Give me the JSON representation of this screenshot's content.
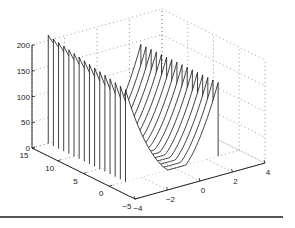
{
  "chart_data": {
    "type": "line",
    "subtype": "3d-waterfall",
    "title": "",
    "xlabel": "",
    "ylabel": "",
    "zlabel": "",
    "x_ticks": [
      -4,
      -2,
      0,
      2,
      4
    ],
    "y_ticks": [
      -5,
      0,
      5,
      10,
      15
    ],
    "z_ticks": [
      0,
      50,
      100,
      150,
      200
    ],
    "xlim": [
      -4,
      4
    ],
    "ylim": [
      -5,
      15
    ],
    "zlim": [
      0,
      200
    ],
    "grid": true,
    "x_range_of_curves": [
      -3,
      2.7
    ],
    "y_values_of_curves": [
      0,
      1,
      2,
      3,
      4,
      5,
      6,
      7,
      8,
      9,
      10,
      11,
      12,
      13,
      14,
      15
    ],
    "series_peaks": [
      {
        "y": 15,
        "peak_x": -2,
        "peak_z": 170
      },
      {
        "y": 10,
        "peak_x": -2,
        "peak_z": 140
      },
      {
        "y": 5,
        "peak_x": -2,
        "peak_z": 110
      },
      {
        "y": 0,
        "peak_x": -2,
        "peak_z": 80
      }
    ],
    "right_end_z": 150
  },
  "colors": {
    "line": "#111111",
    "grid": "#888888",
    "axis": "#222222",
    "rule": "#555555"
  }
}
